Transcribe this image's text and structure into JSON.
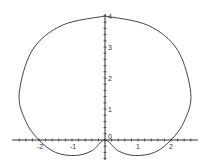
{
  "chart_data": {
    "type": "line",
    "title": "",
    "xlabel": "",
    "ylabel": "",
    "xlim": [
      -2.6,
      2.6
    ],
    "ylim": [
      -0.5,
      4
    ],
    "grid": false,
    "x_ticks": [
      "-2",
      "-1",
      "0",
      "1",
      "2"
    ],
    "y_ticks": [
      "0",
      "1",
      "2",
      "3",
      "4"
    ],
    "series": [
      {
        "name": "polar curve",
        "description": "Cardioid-like closed curve: top at (0,4), widest at x=±2.6 near y=1.5, crossing x-axis at ±2, two lower arcs dipping to about y=-0.5 and meeting at the origin",
        "points": [
          [
            0,
            4
          ],
          [
            1.3,
            3.7
          ],
          [
            2.2,
            2.9
          ],
          [
            2.6,
            1.5
          ],
          [
            2.4,
            0.6
          ],
          [
            2,
            0
          ],
          [
            1.5,
            -0.4
          ],
          [
            0.9,
            -0.5
          ],
          [
            0.4,
            -0.35
          ],
          [
            0,
            0
          ],
          [
            -0.4,
            -0.35
          ],
          [
            -0.9,
            -0.5
          ],
          [
            -1.5,
            -0.4
          ],
          [
            -2,
            0
          ],
          [
            -2.4,
            0.6
          ],
          [
            -2.6,
            1.5
          ],
          [
            -2.2,
            2.9
          ],
          [
            -1.3,
            3.7
          ],
          [
            0,
            4
          ]
        ]
      }
    ]
  }
}
